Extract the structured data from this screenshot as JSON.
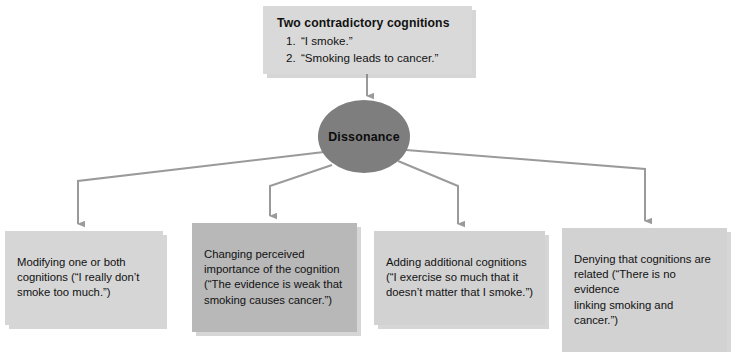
{
  "diagram": {
    "title_node": {
      "heading": "Two contradictory cognitions",
      "items": [
        "“I smoke.”",
        "“Smoking leads to cancer.”"
      ]
    },
    "center_node": {
      "label": "Dissonance"
    },
    "outcomes": [
      {
        "text": "Modifying one or both\ncognitions (“I really don’t\nsmoke too much.”)"
      },
      {
        "text": "Changing perceived\nimportance of the cognition\n(“The evidence is weak that\nsmoking causes cancer.”)"
      },
      {
        "text": "Adding additional cognitions\n(“I exercise so much that it\ndoesn’t matter that I smoke.”)"
      },
      {
        "text": "Denying that cognitions are\nrelated (“There is no evidence\nlinking smoking and cancer.”)"
      }
    ],
    "colors": {
      "connector": "#9a9a9a",
      "center_fill": "#7e7e7e",
      "box_fill": "#d4d4d4",
      "box_fill_highlight": "#b8b8b8",
      "text": "#111111",
      "background": "#ffffff"
    }
  }
}
